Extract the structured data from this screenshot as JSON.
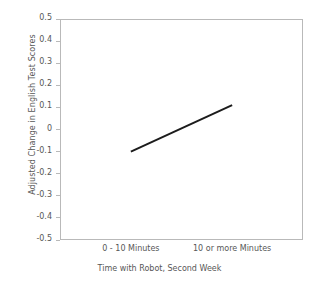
{
  "chart_data": {
    "type": "line",
    "title": "",
    "xlabel": "Time with Robot, Second Week",
    "ylabel": "Adjusted Change in English Test Scores",
    "categories": [
      "0 - 10 Minutes",
      "10 or more Minutes"
    ],
    "series": [
      {
        "name": "Adjusted Change",
        "values": [
          -0.1,
          0.11
        ]
      }
    ],
    "ylim": [
      -0.5,
      0.5
    ],
    "ytick_labels": [
      "0.5",
      "0.4",
      "0.3",
      "0.2",
      "0.1",
      "0",
      "-0.1",
      "-0.2",
      "-0.3",
      "-0.4",
      "-0.5"
    ],
    "ytick_values": [
      0.5,
      0.4,
      0.3,
      0.2,
      0.1,
      0,
      -0.1,
      -0.2,
      -0.3,
      -0.4,
      -0.5
    ],
    "grid": false,
    "legend": "none",
    "markers": "none",
    "line_color": "#1c1c1c",
    "line_width": 2,
    "frame_color": "#b9b9b9",
    "text_color": "#575757",
    "background": "#ffffff"
  }
}
